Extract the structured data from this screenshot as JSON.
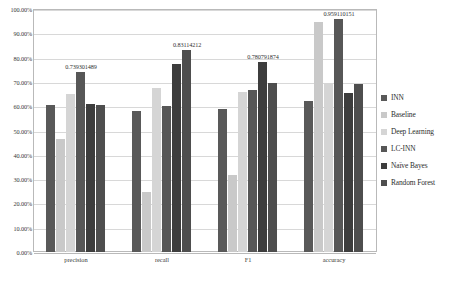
{
  "chart_data": {
    "type": "bar",
    "title": "",
    "xlabel": "",
    "ylabel": "",
    "ylim": [
      0,
      1
    ],
    "grid": true,
    "legend_position": "right",
    "categories": [
      "precision",
      "recall",
      "F1",
      "accuracy"
    ],
    "ytick_labels": [
      "0.00%",
      "10.00%",
      "20.00%",
      "30.00%",
      "40.00%",
      "50.00%",
      "60.00%",
      "70.00%",
      "80.00%",
      "90.00%",
      "100.00%"
    ],
    "ytick_values": [
      0,
      0.1,
      0.2,
      0.3,
      0.4,
      0.5,
      0.6,
      0.7,
      0.8,
      0.9,
      1.0
    ],
    "series": [
      {
        "name": "INN",
        "color": "#595959",
        "values": [
          0.605,
          0.58,
          0.59,
          0.62
        ]
      },
      {
        "name": "Baseline",
        "color": "#c9c9c9",
        "values": [
          0.465,
          0.245,
          0.315,
          0.945
        ]
      },
      {
        "name": "Deep Learning",
        "color": "#d5d5d5",
        "values": [
          0.65,
          0.675,
          0.66,
          0.695
        ]
      },
      {
        "name": "LC-INN",
        "color": "#575757",
        "values": [
          0.739301489,
          0.6,
          0.665,
          0.959110151
        ]
      },
      {
        "name": "Naïve Bayes",
        "color": "#3d3d3d",
        "values": [
          0.61,
          0.775,
          0.780791874,
          0.655
        ]
      },
      {
        "name": "Random Forest",
        "color": "#4e4e4e",
        "values": [
          0.605,
          0.83114212,
          0.695,
          0.69
        ]
      }
    ],
    "data_labels": [
      {
        "category": "precision",
        "series": "LC-INN",
        "text": "0.739301489",
        "value": 0.739301489
      },
      {
        "category": "recall",
        "series": "Random Forest",
        "text": "0.83114212",
        "value": 0.83114212
      },
      {
        "category": "F1",
        "series": "Naïve Bayes",
        "text": "0.780791874",
        "value": 0.780791874
      },
      {
        "category": "accuracy",
        "series": "LC-INN",
        "text": "0.959110151",
        "value": 0.959110151
      }
    ]
  },
  "legend": {
    "items": [
      {
        "label": "INN",
        "color": "#595959"
      },
      {
        "label": "Baseline",
        "color": "#c9c9c9"
      },
      {
        "label": "Deep Learning",
        "color": "#d5d5d5"
      },
      {
        "label": "LC-INN",
        "color": "#575757"
      },
      {
        "label": "Naïve Bayes",
        "color": "#3d3d3d"
      },
      {
        "label": "Random Forest",
        "color": "#4e4e4e"
      }
    ]
  }
}
